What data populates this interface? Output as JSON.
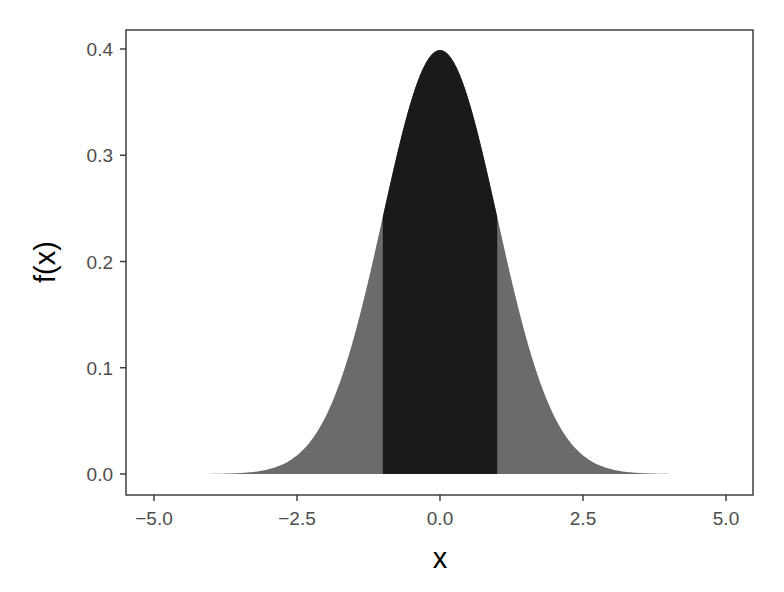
{
  "chart_data": {
    "type": "area",
    "title": "",
    "xlabel": "x",
    "ylabel": "f(x)",
    "xlim": [
      -5,
      5
    ],
    "ylim": [
      0,
      0.4
    ],
    "x_ticks": [
      -5.0,
      -2.5,
      0.0,
      2.5,
      5.0
    ],
    "x_tick_labels": [
      "−5.0",
      "−2.5",
      "0.0",
      "2.5",
      "5.0"
    ],
    "y_ticks": [
      0.0,
      0.1,
      0.2,
      0.3,
      0.4
    ],
    "y_tick_labels": [
      "0.0",
      "0.1",
      "0.2",
      "0.3",
      "0.4"
    ],
    "grid": false,
    "legend": null,
    "series": [
      {
        "name": "standard normal density (full range)",
        "function": "dnorm(x, mean=0, sd=1)",
        "x_range": [
          -5,
          5
        ],
        "fill": "#6b6b6b",
        "x": [
          -5,
          -4,
          -3,
          -2.5,
          -2,
          -1.5,
          -1,
          -0.5,
          0,
          0.5,
          1,
          1.5,
          2,
          2.5,
          3,
          4,
          5
        ],
        "values": [
          1.5e-06,
          0.000134,
          0.00443,
          0.0175,
          0.054,
          0.1295,
          0.242,
          0.352,
          0.399,
          0.352,
          0.242,
          0.1295,
          0.054,
          0.0175,
          0.00443,
          0.000134,
          1.5e-06
        ]
      },
      {
        "name": "shaded region within one SD",
        "function": "dnorm(x, mean=0, sd=1)",
        "x_range": [
          -1,
          1
        ],
        "fill": "#1a1a1a",
        "x": [
          -1,
          -0.5,
          0,
          0.5,
          1
        ],
        "values": [
          0.242,
          0.352,
          0.399,
          0.352,
          0.242
        ]
      }
    ],
    "colors": {
      "outer_fill": "#6b6b6b",
      "inner_fill": "#1a1a1a",
      "panel_border": "#333333",
      "tick_text": "#4d4d4d",
      "axis_title": "#000000"
    }
  }
}
